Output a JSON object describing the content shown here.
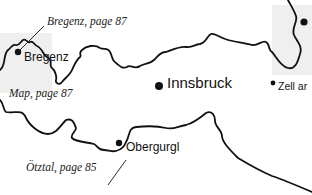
{
  "map": {
    "colors": {
      "background": "#ffffff",
      "inset_shade": "#efefef",
      "border": "#111111",
      "text": "#111111"
    },
    "cities": [
      {
        "name": "Bregenz",
        "size": "medium"
      },
      {
        "name": "Innsbruck",
        "size": "large"
      },
      {
        "name": "Zell am See",
        "visible_text": "Zell ar",
        "size": "small"
      },
      {
        "name": "Obergurgl",
        "size": "medium"
      }
    ],
    "references": [
      {
        "text": "Bregenz, page 87"
      },
      {
        "text": "Map, page 87"
      },
      {
        "text": "Ötztal, page 85"
      }
    ]
  }
}
